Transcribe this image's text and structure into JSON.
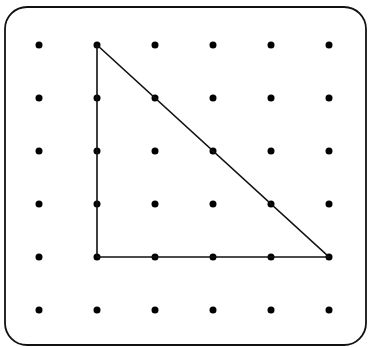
{
  "diagram": {
    "type": "geoboard",
    "grid": {
      "columns": 6,
      "rows": 6,
      "x_positions": [
        39,
        97,
        155,
        213,
        271,
        329
      ],
      "y_positions": [
        45,
        98,
        151,
        204,
        257,
        310
      ],
      "dot_radius": 3.5,
      "dot_color": "#000000"
    },
    "border": {
      "x": 5,
      "y": 7,
      "width": 361,
      "height": 338,
      "radius": 22,
      "color": "#111111"
    },
    "shape": {
      "name": "right-triangle",
      "vertices_grid": [
        [
          1,
          0
        ],
        [
          1,
          4
        ],
        [
          5,
          4
        ]
      ],
      "stroke": "#111111",
      "stroke_width": 1.6
    }
  }
}
